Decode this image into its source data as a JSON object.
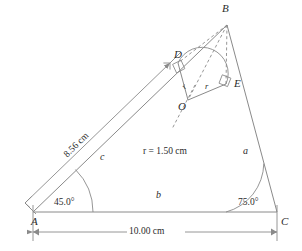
{
  "figure": {
    "kind": "geometry-diagram",
    "stroke_color": "#8a8a8a",
    "text_color": "#2b2b2b",
    "background": "#ffffff"
  },
  "vertices": {
    "A": "A",
    "B": "B",
    "C": "C",
    "D": "D",
    "E": "E",
    "O": "O"
  },
  "sides": {
    "a": "a",
    "b": "b",
    "c": "c"
  },
  "angles": {
    "at_A": "45.0°",
    "at_C": "75.0°"
  },
  "dimensions": {
    "base_AC": "10.00 cm",
    "side_c": "8.56 cm"
  },
  "radius": {
    "value_label": "r = 1.50 cm",
    "leg_OD": "r",
    "leg_OE": "r"
  }
}
